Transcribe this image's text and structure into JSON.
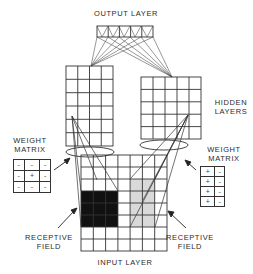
{
  "labels": {
    "output_layer": "OUTPUT LAYER",
    "hidden_layers": "HIDDEN\nLAYERS",
    "weight_matrix_left": "WEIGHT\nMATRIX",
    "weight_matrix_right": "WEIGHT\nMATRIX",
    "receptive_field_left": "RECEPTIVE\nFIELD",
    "receptive_field_right": "RECEPTIVE\nFIELD",
    "input_layer": "INPUT LAYER"
  },
  "output_layer": {
    "units": 5
  },
  "hidden_layer_left": {
    "columns": 4,
    "rows": 6
  },
  "hidden_layer_right": {
    "columns": 5,
    "rows": 5
  },
  "input_layer": {
    "columns": 7,
    "rows": 8,
    "black_receptive_field": {
      "columns": [
        0,
        2
      ],
      "rows": [
        3,
        5
      ]
    },
    "gray_receptive_field": {
      "columns": [
        4,
        5
      ],
      "rows": [
        2,
        5
      ]
    }
  },
  "weight_matrix_left": [
    [
      "-",
      "-",
      "-"
    ],
    [
      "-",
      "+",
      "-"
    ],
    [
      "-",
      "-",
      "-"
    ]
  ],
  "weight_matrix_right": [
    [
      "+",
      "-"
    ],
    [
      "+",
      "-"
    ],
    [
      "+",
      "-"
    ],
    [
      "+",
      "-"
    ]
  ],
  "colors": {
    "black_field": "#111111",
    "gray_field": "#d9d9d9",
    "line": "#333333"
  }
}
